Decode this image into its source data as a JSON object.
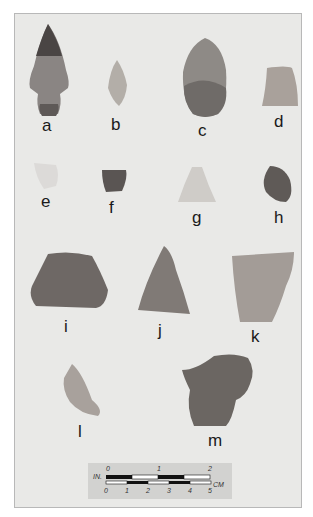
{
  "figure": {
    "background": "#e9e9e7",
    "artifacts": [
      {
        "id": "a",
        "label": "a"
      },
      {
        "id": "b",
        "label": "b"
      },
      {
        "id": "c",
        "label": "c"
      },
      {
        "id": "d",
        "label": "d"
      },
      {
        "id": "e",
        "label": "e"
      },
      {
        "id": "f",
        "label": "f"
      },
      {
        "id": "g",
        "label": "g"
      },
      {
        "id": "h",
        "label": "h"
      },
      {
        "id": "i",
        "label": "i"
      },
      {
        "id": "j",
        "label": "j"
      },
      {
        "id": "k",
        "label": "k"
      },
      {
        "id": "l",
        "label": "l"
      },
      {
        "id": "m",
        "label": "m"
      }
    ],
    "scale_bar": {
      "inch_unit": "IN.",
      "inch_ticks": [
        "0",
        "1",
        "2"
      ],
      "cm_unit": "CM",
      "cm_ticks": [
        "0",
        "1",
        "2",
        "3",
        "4",
        "5"
      ]
    }
  }
}
